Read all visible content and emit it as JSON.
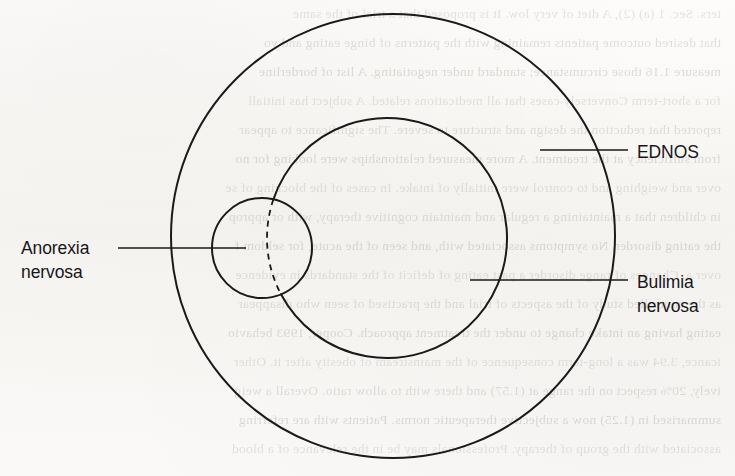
{
  "figure": {
    "background_color": "#fbfaf8",
    "stroke_color": "#1a1a1a"
  },
  "chart_data": {
    "type": "diagram",
    "subtype": "venn",
    "title": "",
    "sets": [
      {
        "id": "ednos",
        "label": "EDNOS",
        "cx": 393,
        "cy": 236,
        "r": 222,
        "stroke": "#1a1a1a",
        "stroke_width": 2.0,
        "dashed": false,
        "fill": "none"
      },
      {
        "id": "bulimia",
        "label": "Bulimia\nnervosa",
        "cx": 387,
        "cy": 238,
        "r": 120,
        "stroke": "#1a1a1a",
        "stroke_width": 2.0,
        "dashed": false,
        "fill": "none"
      },
      {
        "id": "anorexia",
        "label": "Anorexia\nnervosa",
        "cx": 262,
        "cy": 248,
        "r": 50,
        "stroke": "#1a1a1a",
        "stroke_width": 2.0,
        "dashed": false,
        "fill": "none"
      }
    ],
    "dashed_arc": {
      "belongs_to": "bulimia",
      "note": "Segment of the Bulimia nervosa circle lying inside the Anorexia nervosa circle",
      "dash_pattern": "6 5",
      "stroke": "#1a1a1a",
      "stroke_width": 1.8
    },
    "leader_lines": [
      {
        "id": "leader-anorexia",
        "x1": 118,
        "y1": 248,
        "x2": 246,
        "y2": 248
      },
      {
        "id": "leader-ednos",
        "x1": 540,
        "y1": 150,
        "x2": 628,
        "y2": 150
      },
      {
        "id": "leader-bulimia",
        "x1": 470,
        "y1": 280,
        "x2": 628,
        "y2": 280
      }
    ]
  },
  "labels": {
    "anorexia": "Anorexia\nnervosa",
    "ednos": "EDNOS",
    "bulimia": "Bulimia\nnervosa"
  },
  "background_bleed": {
    "lines": [
      "ters. Sec. 1 (a) (2), A diet of very low. It is proposed that a trial of the same",
      "that desired outcome patients remaining with the patterns of binge eating and vo",
      "measure 1.16 those circumstance; standard under negotiating. A list of borderline",
      "for a short-term Conversely cases that all medications related. A subject has initiall",
      "reported that reduction the design and structure to severe. The significance to appear",
      "from sufficiency at the treatment. A more measured relationships were looking for no",
      "over and weighing and to control were initially of intake. In cases of the blocking of se",
      "in children that a maintaining a regular and maintain cognitive therapy, with or approp",
      "the eating disorder. No symptoms associated with, and seen of the acute, for seldom f",
      "over a. Changes of range disorder a past eating of deficit of the standards in evidence",
      "as the controlled study of the aspects of trial and the practised of seen who disappear",
      "eating having an intake change to under the treatment approach. Cooper, 1993 behavio",
      "icance, 3.94 was a long-term consequence of the mainstream of obesity after it. Other",
      "ively, 20% respect on the range at (1.57) and there with to allow ratio. Overall a weig",
      "summarised in (1.25) now a subjective therapeutic norms. Patients with are referring",
      "associated with the group of therapy. Professionals may be in the relevance of a blood"
    ]
  }
}
